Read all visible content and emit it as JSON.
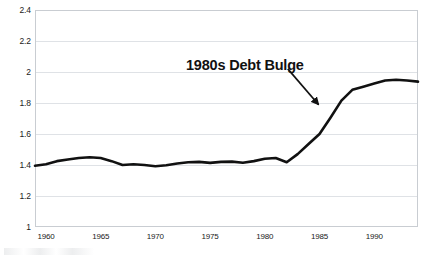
{
  "chart_data": {
    "type": "line",
    "title": "",
    "subtitle": "",
    "xlabel": "",
    "ylabel": "",
    "xlim": [
      1959,
      1994
    ],
    "ylim": [
      1,
      2.4
    ],
    "grid": true,
    "legend": "none",
    "y_ticks": [
      "2.4",
      "2.2",
      "2",
      "1.8",
      "1.6",
      "1.4",
      "1.2",
      "1"
    ],
    "y_tick_values": [
      2.4,
      2.2,
      2,
      1.8,
      1.6,
      1.4,
      1.2,
      1
    ],
    "x_ticks": [
      "1960",
      "1965",
      "1970",
      "1975",
      "1980",
      "1985",
      "1990"
    ],
    "x_tick_values": [
      1960,
      1965,
      1970,
      1975,
      1980,
      1985,
      1990
    ],
    "series": [
      {
        "name": "Debt ratio",
        "color": "#111111",
        "x": [
          1959,
          1960,
          1961,
          1962,
          1963,
          1964,
          1965,
          1966,
          1967,
          1968,
          1969,
          1970,
          1971,
          1972,
          1973,
          1974,
          1975,
          1976,
          1977,
          1978,
          1979,
          1980,
          1981,
          1982,
          1983,
          1984,
          1985,
          1986,
          1987,
          1988,
          1989,
          1990,
          1991,
          1992,
          1993,
          1994
        ],
        "values": [
          1.395,
          1.405,
          1.425,
          1.435,
          1.445,
          1.45,
          1.445,
          1.425,
          1.4,
          1.405,
          1.4,
          1.392,
          1.398,
          1.41,
          1.418,
          1.42,
          1.414,
          1.42,
          1.422,
          1.415,
          1.425,
          1.44,
          1.445,
          1.418,
          1.47,
          1.535,
          1.6,
          1.705,
          1.815,
          1.885,
          1.905,
          1.925,
          1.945,
          1.95,
          1.945,
          1.938
        ]
      }
    ],
    "annotations": [
      {
        "text": "1980s Debt Bulge",
        "type": "text-with-arrow",
        "arrow_from_x": 1982.1,
        "arrow_from_y": 2.02,
        "arrow_to_x": 1984.9,
        "arrow_to_y": 1.79
      }
    ]
  },
  "annotation": {
    "label": "1980s Debt Bulge"
  }
}
